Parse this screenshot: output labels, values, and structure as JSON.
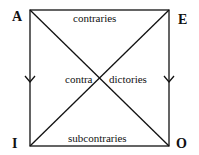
{
  "diagram": {
    "corners": {
      "top_left": "A",
      "top_right": "E",
      "bottom_left": "I",
      "bottom_right": "O"
    },
    "relations": {
      "top": "contraries",
      "center_left": "contra",
      "center_right": "dictories",
      "bottom": "subcontraries"
    },
    "line_color": "#111111"
  }
}
